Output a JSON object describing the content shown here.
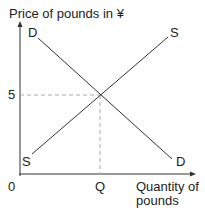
{
  "diagram": {
    "type": "supply-demand",
    "y_axis_label": "Price of pounds in ¥",
    "x_axis_label_line1": "Quantity of",
    "x_axis_label_line2": "pounds",
    "origin_label": "0",
    "equilibrium_price_label": "5",
    "equilibrium_quantity_label": "Q",
    "demand_top_label": "D",
    "demand_bottom_label": "D",
    "supply_top_label": "S",
    "supply_bottom_label": "S",
    "colors": {
      "line": "#333333",
      "dashed": "#aaaaaa"
    }
  }
}
